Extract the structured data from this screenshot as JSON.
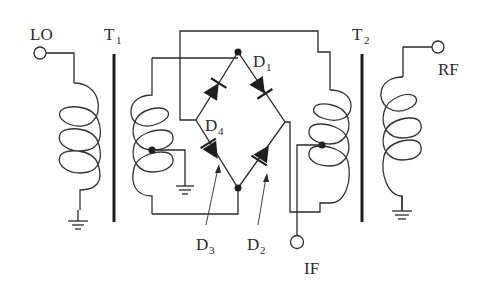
{
  "diagram": {
    "type": "double-balanced diode ring mixer schematic",
    "ports": [
      {
        "id": "lo",
        "label": "LO"
      },
      {
        "id": "rf",
        "label": "RF"
      },
      {
        "id": "if",
        "label": "IF"
      }
    ],
    "transformers": [
      {
        "id": "t1",
        "label": "T",
        "subscript": "1"
      },
      {
        "id": "t2",
        "label": "T",
        "subscript": "2"
      }
    ],
    "diodes": [
      {
        "id": "d1",
        "label": "D",
        "subscript": "1"
      },
      {
        "id": "d2",
        "label": "D",
        "subscript": "2"
      },
      {
        "id": "d3",
        "label": "D",
        "subscript": "3"
      },
      {
        "id": "d4",
        "label": "D",
        "subscript": "4"
      }
    ],
    "colors": {
      "ink": "#2a2a2a",
      "background": "#ffffff"
    }
  }
}
